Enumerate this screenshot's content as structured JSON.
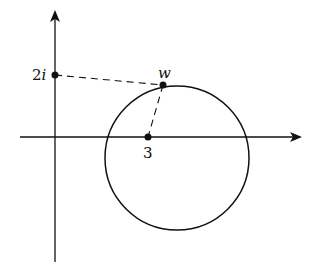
{
  "diagram": {
    "type": "complex-plane",
    "colors": {
      "ink": "#111111",
      "background": "#ffffff"
    },
    "axes": {
      "x_axis": {
        "x1": 20,
        "y": 137,
        "x2": 300
      },
      "y_axis": {
        "x": 55,
        "y1": 262,
        "y2": 12
      }
    },
    "circle": {
      "cx": 177,
      "cy": 158,
      "r": 72
    },
    "points": [
      {
        "id": "two-i",
        "label": "2i",
        "label_num": "2",
        "label_var": "i",
        "x": 55,
        "y": 75,
        "label_x": 32,
        "label_y": 80
      },
      {
        "id": "w",
        "label": "w",
        "x": 163,
        "y": 85,
        "label_x": 158,
        "label_y": 78
      },
      {
        "id": "three",
        "label": "3",
        "x": 148,
        "y": 137,
        "label_x": 143,
        "label_y": 158
      }
    ],
    "dashed_segments": [
      {
        "from": "two-i",
        "to": "w"
      },
      {
        "from": "w",
        "to": "three"
      }
    ]
  }
}
